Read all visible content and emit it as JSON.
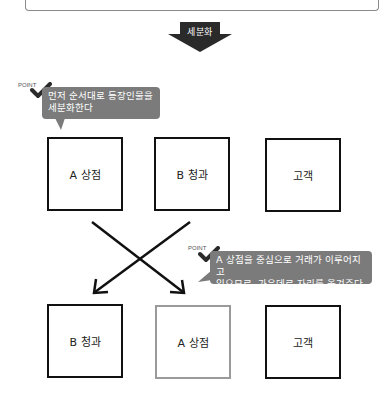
{
  "arrow": {
    "label": "세분화",
    "color": "#2a2a2a"
  },
  "callouts": [
    {
      "tag": "POINT",
      "text_lines": [
        "먼저 순서대로 등장인물을",
        "세분화한다"
      ],
      "color": "#7b7b7b"
    },
    {
      "tag": "POINT",
      "text_lines": [
        "A 상점을 중심으로 거래가 이루어지고",
        "있으므로, 가운데로 자리를 옮겨준다"
      ],
      "color": "#7b7b7b"
    }
  ],
  "rows": [
    {
      "boxes": [
        {
          "label": "A 상점"
        },
        {
          "label": "B 청과"
        },
        {
          "label": "고객"
        }
      ]
    },
    {
      "boxes": [
        {
          "label": "B 청과"
        },
        {
          "label": "A 상점",
          "highlight": "gray"
        },
        {
          "label": "고객"
        }
      ]
    }
  ],
  "colors": {
    "box_border": "#111111",
    "highlight_border": "#9a9a9a",
    "check": "#2b2b2b"
  }
}
